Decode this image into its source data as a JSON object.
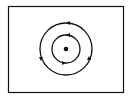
{
  "diagram": {
    "title": "",
    "colors": {
      "stroke": "#111111",
      "background": "#ffffff"
    },
    "center": {
      "x": 66,
      "y": 49
    },
    "orbits": [
      {
        "name": "outer-orbit",
        "radius": 26,
        "direction": "counterclockwise",
        "arrow_count": 3
      },
      {
        "name": "inner-orbit",
        "radius": 14,
        "direction": "counterclockwise",
        "arrow_count": 2
      }
    ],
    "nucleus": {
      "radius": 2.3
    }
  }
}
